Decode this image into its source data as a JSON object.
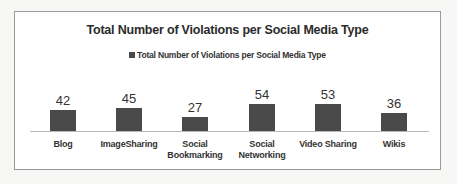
{
  "chart_data": {
    "type": "bar",
    "title": "Total Number of Violations per Social Media Type",
    "categories": [
      "Blog",
      "ImageSharing",
      "Social Bookmarking",
      "Social Networking",
      "Video Sharing",
      "Wikis"
    ],
    "category_lines": [
      [
        "Blog"
      ],
      [
        "ImageSharing"
      ],
      [
        "Social",
        "Bookmarking"
      ],
      [
        "Social",
        "Networking"
      ],
      [
        "Video Sharing"
      ],
      [
        "Wikis"
      ]
    ],
    "series": [
      {
        "name": "Total Number of Violations per Social Media Type",
        "values": [
          42,
          45,
          27,
          54,
          53,
          36
        ]
      }
    ],
    "values": [
      42,
      45,
      27,
      54,
      53,
      36
    ],
    "xlabel": "",
    "ylabel": "",
    "ylim": [
      0,
      54
    ],
    "grid": false,
    "legend_position": "top",
    "data_labels": true,
    "bar_color": "#4a4a4a"
  },
  "legend": {
    "label": "Total Number of Violations per Social Media Type",
    "color": "#4a4a4a"
  },
  "title": "Total Number of Violations per Social Media Type"
}
